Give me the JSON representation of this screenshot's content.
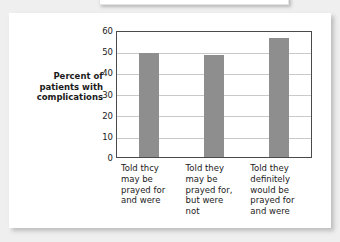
{
  "chart_data": {
    "type": "bar",
    "title": "",
    "xlabel": "",
    "ylabel": "Percent of patients with complications",
    "ylabel_lines": [
      "Percent of",
      "patients with",
      "complications"
    ],
    "categories": [
      "Told thcy may be prayed for and were",
      "Told they may be prayed for, but were not",
      "Told they definitely would be prayed for and were"
    ],
    "category_lines": [
      [
        "Told thcy",
        "may be",
        "prayed for",
        "and were"
      ],
      [
        "Told they",
        "may be",
        "prayed for,",
        "but were",
        "not"
      ],
      [
        "Told they",
        "definitely",
        "would be",
        "prayed for",
        "and were"
      ]
    ],
    "values": [
      50,
      49,
      57
    ],
    "ylim": [
      0,
      60
    ],
    "yticks": [
      0,
      10,
      20,
      30,
      40,
      50,
      60
    ],
    "ytick_labels": [
      "0",
      "10",
      "20",
      "30",
      "40",
      "50",
      "60"
    ],
    "grid": true,
    "gridlines_at": [
      10,
      20,
      30,
      40,
      50
    ],
    "legend": "none",
    "bar_color": "#8e8e8e",
    "axis_color": "#4a4a4a",
    "grid_color": "#c9c9c9",
    "text_color": "#1b1b1b",
    "background": "#ffffff",
    "page_background": "#efeff0"
  }
}
